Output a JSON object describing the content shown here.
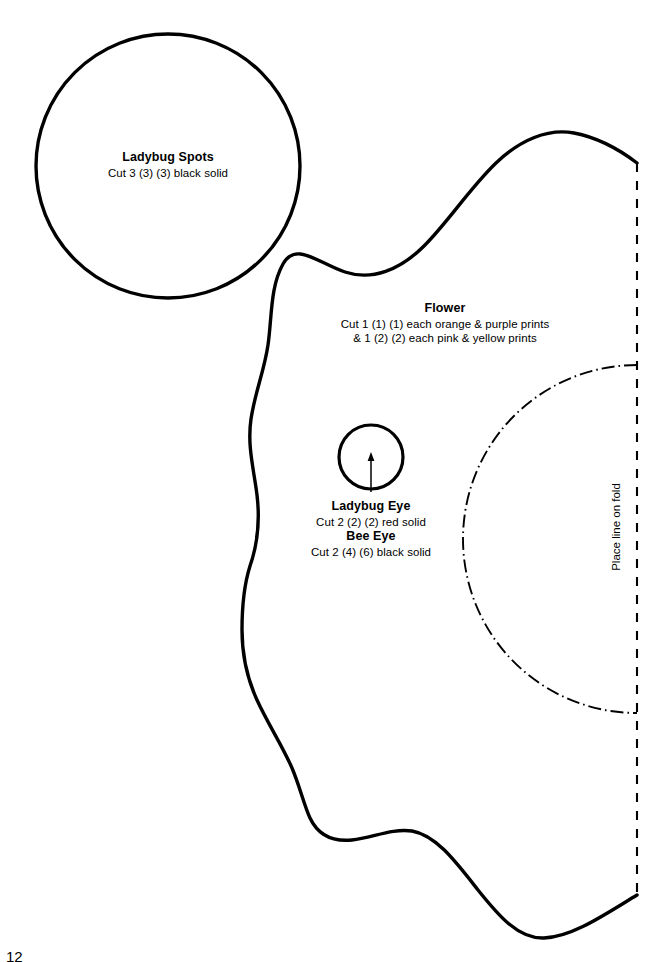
{
  "page": {
    "background_color": "#ffffff",
    "ink_color": "#000000",
    "page_number": "12"
  },
  "pieces": {
    "ladybug_spots": {
      "title": "Ladybug Spots",
      "instructions": "Cut 3 (3) (3) black solid",
      "shape": "circle"
    },
    "flower": {
      "title": "Flower",
      "instructions_line1": "Cut 1 (1) (1) each orange & purple prints",
      "instructions_line2": "& 1 (2) (2) each pink & yellow prints",
      "shape": "scalloped-half-flower"
    },
    "ladybug_eye": {
      "title": "Ladybug Eye",
      "instructions": "Cut 2 (2) (2) red solid",
      "shape": "circle"
    },
    "bee_eye": {
      "title": "Bee Eye",
      "instructions": "Cut 2 (4) (6) black solid",
      "shape": "circle"
    }
  },
  "fold": {
    "label": "Place line on fold",
    "line_style": "dashed"
  },
  "inner_arc": {
    "line_style": "dash-dot"
  }
}
